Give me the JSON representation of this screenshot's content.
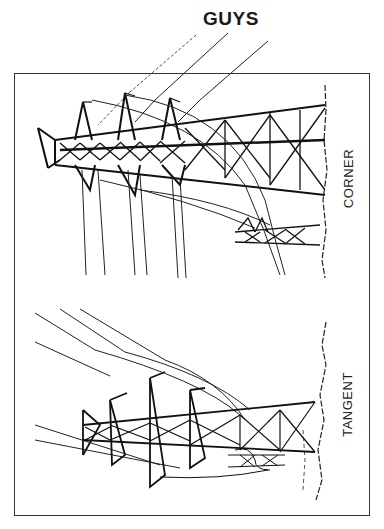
{
  "diagram": {
    "title": "GUYS",
    "panels": [
      {
        "id": "corner",
        "label": "CORNER",
        "description": "Guyed corner transmission tower with three crossarm peaks, conductors and guy wires"
      },
      {
        "id": "tangent",
        "label": "TANGENT",
        "description": "Tangent transmission tower with three crossarm peaks and conductors"
      }
    ],
    "colors": {
      "line": "#1a1a1a",
      "background": "#ffffff",
      "frame": "#333333"
    }
  }
}
